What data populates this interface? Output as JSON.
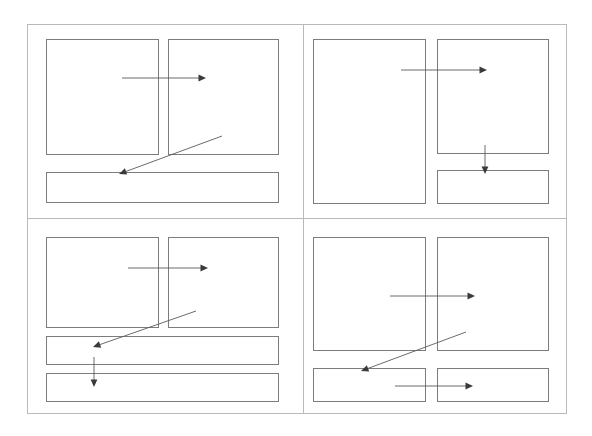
{
  "canvas": {
    "width": 592,
    "height": 436,
    "background": "#ffffff",
    "title": "Wireframe layout grid"
  },
  "style": {
    "frame_stroke": "#b9b9b9",
    "panel_stroke": "#7c7c7c",
    "panel_fill": "#ffffff",
    "arrow_stroke": "#5a5a5a",
    "arrow_head_fill": "#3a3a3a",
    "frame_stroke_width": 1,
    "panel_stroke_width": 1,
    "arrow_stroke_width": 0.9
  },
  "frame": {
    "name": "outer-frame",
    "x": 27,
    "y": 24,
    "width": 539,
    "height": 389
  },
  "dividers": [
    {
      "name": "vertical-divider",
      "orientation": "vertical",
      "x1": 303,
      "y1": 24,
      "x2": 303,
      "y2": 413
    },
    {
      "name": "horizontal-divider",
      "orientation": "horizontal",
      "x1": 27,
      "y1": 218,
      "x2": 566,
      "y2": 218
    }
  ],
  "quadrants": [
    {
      "name": "quadrant-top-left",
      "label": "Layout A",
      "panels": [
        {
          "name": "panel-a-left",
          "label": "Panel A1",
          "x": 46,
          "y": 39,
          "width": 112,
          "height": 115
        },
        {
          "name": "panel-a-right",
          "label": "Panel A2",
          "x": 168,
          "y": 39,
          "width": 110,
          "height": 115
        },
        {
          "name": "panel-a-bottom-bar",
          "label": "Bar A3",
          "x": 46,
          "y": 172,
          "width": 232,
          "height": 30
        }
      ],
      "arrows": [
        {
          "name": "arrow-a-left-to-right",
          "kind": "horizontal-right",
          "x1": 122,
          "y1": 78,
          "x2": 206,
          "y2": 78
        },
        {
          "name": "arrow-a-right-to-bar",
          "kind": "diagonal-down-left",
          "x1": 222,
          "y1": 136,
          "x2": 119,
          "y2": 174
        }
      ]
    },
    {
      "name": "quadrant-top-right",
      "label": "Layout B",
      "panels": [
        {
          "name": "panel-b-left-tall",
          "label": "Panel B1",
          "x": 313,
          "y": 39,
          "width": 112,
          "height": 164
        },
        {
          "name": "panel-b-right-top",
          "label": "Panel B2",
          "x": 437,
          "y": 39,
          "width": 111,
          "height": 114
        },
        {
          "name": "panel-b-right-bottom",
          "label": "Panel B3",
          "x": 437,
          "y": 170,
          "width": 111,
          "height": 33
        }
      ],
      "arrows": [
        {
          "name": "arrow-b-left-to-right",
          "kind": "horizontal-right",
          "x1": 401,
          "y1": 70,
          "x2": 487,
          "y2": 70
        },
        {
          "name": "arrow-b-top-to-bottom",
          "kind": "vertical-down",
          "x1": 485,
          "y1": 145,
          "x2": 485,
          "y2": 174
        }
      ]
    },
    {
      "name": "quadrant-bottom-left",
      "label": "Layout C",
      "panels": [
        {
          "name": "panel-c-left",
          "label": "Panel C1",
          "x": 46,
          "y": 237,
          "width": 112,
          "height": 90
        },
        {
          "name": "panel-c-right",
          "label": "Panel C2",
          "x": 168,
          "y": 237,
          "width": 110,
          "height": 90
        },
        {
          "name": "panel-c-bar-1",
          "label": "Bar C3",
          "x": 46,
          "y": 336,
          "width": 232,
          "height": 28
        },
        {
          "name": "panel-c-bar-2",
          "label": "Bar C4",
          "x": 46,
          "y": 373,
          "width": 232,
          "height": 28
        }
      ],
      "arrows": [
        {
          "name": "arrow-c-left-to-right",
          "kind": "horizontal-right",
          "x1": 128,
          "y1": 268,
          "x2": 208,
          "y2": 268
        },
        {
          "name": "arrow-c-right-to-bar",
          "kind": "diagonal-down-left",
          "x1": 196,
          "y1": 311,
          "x2": 93,
          "y2": 347
        },
        {
          "name": "arrow-c-bar1-to-bar2",
          "kind": "vertical-down",
          "x1": 94,
          "y1": 357,
          "x2": 94,
          "y2": 387
        }
      ]
    },
    {
      "name": "quadrant-bottom-right",
      "label": "Layout D",
      "panels": [
        {
          "name": "panel-d-left",
          "label": "Panel D1",
          "x": 313,
          "y": 237,
          "width": 112,
          "height": 113
        },
        {
          "name": "panel-d-right",
          "label": "Panel D2",
          "x": 437,
          "y": 237,
          "width": 111,
          "height": 113
        },
        {
          "name": "panel-d-bottom-left",
          "label": "Bar D3",
          "x": 313,
          "y": 368,
          "width": 112,
          "height": 33
        },
        {
          "name": "panel-d-bottom-right",
          "label": "Bar D4",
          "x": 437,
          "y": 368,
          "width": 111,
          "height": 33
        }
      ],
      "arrows": [
        {
          "name": "arrow-d-left-to-right",
          "kind": "horizontal-right",
          "x1": 390,
          "y1": 296,
          "x2": 475,
          "y2": 296
        },
        {
          "name": "arrow-d-right-to-bar",
          "kind": "diagonal-down-left",
          "x1": 466,
          "y1": 332,
          "x2": 361,
          "y2": 371
        },
        {
          "name": "arrow-d-bar3-to-bar4",
          "kind": "horizontal-right",
          "x1": 395,
          "y1": 386,
          "x2": 473,
          "y2": 386
        }
      ]
    }
  ]
}
